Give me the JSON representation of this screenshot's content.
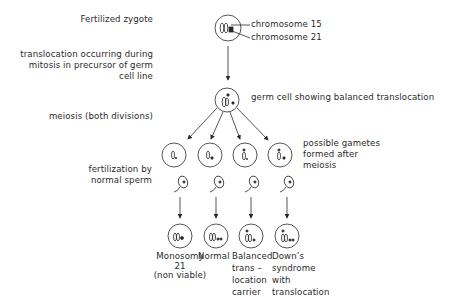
{
  "stages": {
    "zygote": "Fertilized zygote",
    "translocation": [
      "translocation occurring during",
      "mitosis in precursor of germ",
      "cell line"
    ],
    "meiosis": "meiosis (both divisions)",
    "fertilization": [
      "fertilization by",
      "normal sperm"
    ]
  },
  "callouts": {
    "chromosome_15": "chromosome 15",
    "chromosome_21": "chromosome 21",
    "germ_cell": "germ cell showing balanced translocation",
    "gametes": [
      "possible gametes",
      "formed after",
      "meiosis"
    ]
  },
  "outcomes": [
    {
      "lines": [
        "Monosomy",
        "21",
        "(non viable)"
      ]
    },
    {
      "lines": [
        "Normal"
      ]
    },
    {
      "lines": [
        "Balanced",
        "trans –",
        "location",
        "carrier"
      ]
    },
    {
      "lines": [
        "Down’s",
        "syndrome",
        "with",
        "translocation"
      ]
    }
  ],
  "colors": {
    "ink": "#2a2a2a",
    "background": "#ffffff"
  }
}
